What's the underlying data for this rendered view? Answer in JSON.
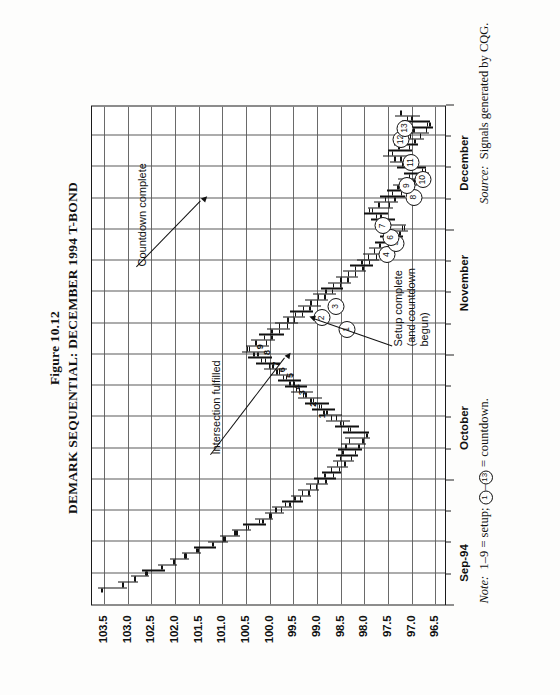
{
  "figure": {
    "number_label": "Figure 10.12",
    "title": "DEMARK SEQUENTIAL: DECEMBER 1994 T-BOND"
  },
  "footnotes": {
    "note_prefix": "Note:",
    "note_text_a": "  1–9 = setup; ",
    "note_circle_low": "1",
    "note_dash": "–",
    "note_circle_high": "13",
    "note_text_b": " = countdown.",
    "source_prefix": "Source:",
    "source_text": "  Signals generated by CQG."
  },
  "annotations": [
    {
      "name": "intersection-fulfilled",
      "text": "Intersection fulfilled"
    },
    {
      "name": "setup-complete",
      "text": "Setup complete\n(and countdown\nbegun)"
    },
    {
      "name": "countdown-complete",
      "text": "Countdown complete"
    }
  ],
  "colors": {
    "ink": "#111111",
    "grid": "#5b5b5b",
    "frame": "#1a1a1a",
    "paper": "#fdfdfc"
  },
  "chart_data": {
    "type": "bar",
    "subtype": "ohlc-bar-chart",
    "title": "DEMARK SEQUENTIAL: DECEMBER 1994 T-BOND",
    "xlabel": "",
    "ylabel": "",
    "ylim": [
      96.25,
      103.75
    ],
    "ytick_labels": [
      "103.5",
      "103.0",
      "102.5",
      "102.0",
      "101.5",
      "101.0",
      "100.5",
      "100.0",
      "99.5",
      "99.0",
      "98.5",
      "98.0",
      "97.5",
      "97.0",
      "96.5"
    ],
    "ytick_values": [
      103.5,
      103.0,
      102.5,
      102.0,
      101.5,
      101.0,
      100.5,
      100.0,
      99.5,
      99.0,
      98.5,
      98.0,
      97.5,
      97.0,
      96.5
    ],
    "grid": true,
    "legend": "none",
    "x_month_labels": [
      "Sep-94",
      "October",
      "November",
      "December"
    ],
    "x_month_positions": [
      0.085,
      0.355,
      0.645,
      0.885
    ],
    "series_name": "December 1994 T-Bond daily OHLC",
    "ohlc": [
      {
        "i": 0,
        "h": 103.62,
        "l": 103.0,
        "o": 103.55,
        "c": 103.12
      },
      {
        "i": 1,
        "h": 103.2,
        "l": 102.78,
        "o": 103.1,
        "c": 102.84
      },
      {
        "i": 2,
        "h": 102.92,
        "l": 102.55,
        "o": 102.86,
        "c": 102.6
      },
      {
        "i": 3,
        "h": 102.7,
        "l": 102.2,
        "o": 102.62,
        "c": 102.28
      },
      {
        "i": 4,
        "h": 102.35,
        "l": 101.95,
        "o": 102.3,
        "c": 102.02
      },
      {
        "i": 5,
        "h": 102.1,
        "l": 101.7,
        "o": 102.04,
        "c": 101.78
      },
      {
        "i": 6,
        "h": 101.85,
        "l": 101.45,
        "o": 101.8,
        "c": 101.52
      },
      {
        "i": 7,
        "h": 101.6,
        "l": 101.12,
        "o": 101.55,
        "c": 101.2
      },
      {
        "i": 8,
        "h": 101.3,
        "l": 100.88,
        "o": 101.22,
        "c": 100.95
      },
      {
        "i": 9,
        "h": 101.05,
        "l": 100.62,
        "o": 100.98,
        "c": 100.7
      },
      {
        "i": 10,
        "h": 100.8,
        "l": 100.4,
        "o": 100.74,
        "c": 100.46
      },
      {
        "i": 11,
        "h": 100.55,
        "l": 100.08,
        "o": 100.5,
        "c": 100.15
      },
      {
        "i": 12,
        "h": 100.3,
        "l": 99.92,
        "o": 100.22,
        "c": 99.98
      },
      {
        "i": 13,
        "h": 100.1,
        "l": 99.7,
        "o": 100.02,
        "c": 99.76
      },
      {
        "i": 14,
        "h": 99.95,
        "l": 99.52,
        "o": 99.88,
        "c": 99.58
      },
      {
        "i": 15,
        "h": 99.74,
        "l": 99.3,
        "o": 99.68,
        "c": 99.36
      },
      {
        "i": 16,
        "h": 99.55,
        "l": 99.12,
        "o": 99.48,
        "c": 99.18
      },
      {
        "i": 17,
        "h": 99.4,
        "l": 98.95,
        "o": 99.32,
        "c": 99.02
      },
      {
        "i": 18,
        "h": 99.22,
        "l": 98.76,
        "o": 99.15,
        "c": 98.82
      },
      {
        "i": 19,
        "h": 99.05,
        "l": 98.6,
        "o": 98.98,
        "c": 98.66
      },
      {
        "i": 20,
        "h": 98.9,
        "l": 98.48,
        "o": 98.84,
        "c": 98.54
      },
      {
        "i": 21,
        "h": 98.78,
        "l": 98.35,
        "o": 98.7,
        "c": 98.42
      },
      {
        "i": 22,
        "h": 98.66,
        "l": 98.22,
        "o": 98.58,
        "c": 98.28
      },
      {
        "i": 23,
        "h": 98.6,
        "l": 98.14,
        "o": 98.52,
        "c": 98.2
      },
      {
        "i": 24,
        "h": 98.55,
        "l": 98.05,
        "o": 98.46,
        "c": 98.12
      },
      {
        "i": 25,
        "h": 98.48,
        "l": 97.96,
        "o": 98.4,
        "c": 98.04
      },
      {
        "i": 26,
        "h": 98.4,
        "l": 97.88,
        "o": 98.32,
        "c": 97.94
      },
      {
        "i": 27,
        "h": 98.45,
        "l": 97.9,
        "o": 97.96,
        "c": 98.34
      },
      {
        "i": 28,
        "h": 98.62,
        "l": 98.1,
        "o": 98.3,
        "c": 98.52
      },
      {
        "i": 29,
        "h": 98.8,
        "l": 98.3,
        "o": 98.45,
        "c": 98.7
      },
      {
        "i": 30,
        "h": 98.95,
        "l": 98.46,
        "o": 98.6,
        "c": 98.86
      },
      {
        "i": 31,
        "h": 99.1,
        "l": 98.62,
        "o": 98.8,
        "c": 98.96
      },
      {
        "i": 32,
        "h": 99.25,
        "l": 98.74,
        "o": 98.92,
        "c": 99.14
      },
      {
        "i": 33,
        "h": 99.4,
        "l": 98.9,
        "o": 99.08,
        "c": 99.3
      },
      {
        "i": 34,
        "h": 99.55,
        "l": 99.08,
        "o": 99.24,
        "c": 99.44
      },
      {
        "i": 35,
        "h": 99.68,
        "l": 99.2,
        "o": 99.38,
        "c": 99.58
      },
      {
        "i": 36,
        "h": 99.82,
        "l": 99.34,
        "o": 99.5,
        "c": 99.72
      },
      {
        "i": 37,
        "h": 99.96,
        "l": 99.48,
        "o": 99.66,
        "c": 99.86
      },
      {
        "i": 38,
        "h": 100.12,
        "l": 99.62,
        "o": 99.8,
        "c": 100.02
      },
      {
        "i": 39,
        "h": 100.28,
        "l": 99.78,
        "o": 99.94,
        "c": 100.18
      },
      {
        "i": 40,
        "h": 100.45,
        "l": 99.94,
        "o": 100.1,
        "c": 100.34
      },
      {
        "i": 41,
        "h": 100.58,
        "l": 100.1,
        "o": 100.26,
        "c": 100.48
      },
      {
        "i": 42,
        "h": 100.5,
        "l": 100.0,
        "o": 100.44,
        "c": 100.08
      },
      {
        "i": 43,
        "h": 100.4,
        "l": 99.88,
        "o": 100.3,
        "c": 99.96
      },
      {
        "i": 44,
        "h": 100.22,
        "l": 99.7,
        "o": 100.12,
        "c": 99.8
      },
      {
        "i": 45,
        "h": 100.05,
        "l": 99.56,
        "o": 99.96,
        "c": 99.64
      },
      {
        "i": 46,
        "h": 99.88,
        "l": 99.4,
        "o": 99.8,
        "c": 99.48
      },
      {
        "i": 47,
        "h": 99.72,
        "l": 99.24,
        "o": 99.62,
        "c": 99.32
      },
      {
        "i": 48,
        "h": 99.56,
        "l": 99.08,
        "o": 99.46,
        "c": 99.16
      },
      {
        "i": 49,
        "h": 99.4,
        "l": 98.92,
        "o": 99.3,
        "c": 99.0
      },
      {
        "i": 50,
        "h": 99.24,
        "l": 98.76,
        "o": 99.14,
        "c": 98.84
      },
      {
        "i": 51,
        "h": 99.08,
        "l": 98.6,
        "o": 98.98,
        "c": 98.68
      },
      {
        "i": 52,
        "h": 98.92,
        "l": 98.44,
        "o": 98.82,
        "c": 98.52
      },
      {
        "i": 53,
        "h": 98.76,
        "l": 98.28,
        "o": 98.66,
        "c": 98.36
      },
      {
        "i": 54,
        "h": 98.6,
        "l": 98.12,
        "o": 98.5,
        "c": 98.2
      },
      {
        "i": 55,
        "h": 98.44,
        "l": 97.96,
        "o": 98.34,
        "c": 98.04
      },
      {
        "i": 56,
        "h": 98.3,
        "l": 97.82,
        "o": 98.2,
        "c": 97.9
      },
      {
        "i": 57,
        "h": 98.16,
        "l": 97.68,
        "o": 98.06,
        "c": 97.76
      },
      {
        "i": 58,
        "h": 98.02,
        "l": 97.54,
        "o": 97.92,
        "c": 97.62
      },
      {
        "i": 59,
        "h": 97.9,
        "l": 97.42,
        "o": 97.8,
        "c": 97.5
      },
      {
        "i": 60,
        "h": 97.78,
        "l": 97.3,
        "o": 97.68,
        "c": 97.38
      },
      {
        "i": 61,
        "h": 97.66,
        "l": 97.18,
        "o": 97.56,
        "c": 97.26
      },
      {
        "i": 62,
        "h": 97.56,
        "l": 97.08,
        "o": 97.46,
        "c": 97.16
      },
      {
        "i": 63,
        "h": 97.7,
        "l": 97.12,
        "o": 97.2,
        "c": 97.6
      },
      {
        "i": 64,
        "h": 97.86,
        "l": 97.34,
        "o": 97.5,
        "c": 97.76
      },
      {
        "i": 65,
        "h": 98.0,
        "l": 97.5,
        "o": 97.66,
        "c": 97.9
      },
      {
        "i": 66,
        "h": 97.92,
        "l": 97.4,
        "o": 97.84,
        "c": 97.48
      },
      {
        "i": 67,
        "h": 97.8,
        "l": 97.28,
        "o": 97.7,
        "c": 97.36
      },
      {
        "i": 68,
        "h": 97.66,
        "l": 97.14,
        "o": 97.56,
        "c": 97.22
      },
      {
        "i": 69,
        "h": 97.52,
        "l": 97.0,
        "o": 97.42,
        "c": 97.08
      },
      {
        "i": 70,
        "h": 97.4,
        "l": 96.88,
        "o": 97.3,
        "c": 96.96
      },
      {
        "i": 71,
        "h": 97.28,
        "l": 96.76,
        "o": 97.18,
        "c": 96.84
      },
      {
        "i": 72,
        "h": 97.16,
        "l": 96.64,
        "o": 97.06,
        "c": 96.72
      },
      {
        "i": 73,
        "h": 97.3,
        "l": 96.7,
        "o": 96.78,
        "c": 97.2
      },
      {
        "i": 74,
        "h": 97.46,
        "l": 96.92,
        "o": 97.1,
        "c": 97.36
      },
      {
        "i": 75,
        "h": 97.6,
        "l": 97.08,
        "o": 97.24,
        "c": 97.5
      },
      {
        "i": 76,
        "h": 97.5,
        "l": 96.98,
        "o": 97.42,
        "c": 97.06
      },
      {
        "i": 77,
        "h": 97.38,
        "l": 96.86,
        "o": 97.28,
        "c": 96.94
      },
      {
        "i": 78,
        "h": 97.26,
        "l": 96.74,
        "o": 97.16,
        "c": 96.82
      },
      {
        "i": 79,
        "h": 97.14,
        "l": 96.62,
        "o": 97.04,
        "c": 96.7
      },
      {
        "i": 80,
        "h": 97.05,
        "l": 96.54,
        "o": 96.96,
        "c": 96.62
      },
      {
        "i": 81,
        "h": 97.2,
        "l": 96.6,
        "o": 96.68,
        "c": 97.1
      },
      {
        "i": 82,
        "h": 97.34,
        "l": 96.82,
        "o": 97.0,
        "c": 97.24
      }
    ],
    "setup_markers": [
      {
        "label": "1",
        "i": 30,
        "price": 98.66
      },
      {
        "label": "2",
        "i": 32,
        "price": 98.84
      },
      {
        "label": "3",
        "i": 34,
        "price": 99.08
      },
      {
        "label": "4",
        "i": 35,
        "price": 99.18
      },
      {
        "label": "5",
        "i": 37,
        "price": 99.34
      },
      {
        "label": "6",
        "i": 38,
        "price": 99.5
      },
      {
        "label": "7",
        "i": 39,
        "price": 99.64
      },
      {
        "label": "8",
        "i": 41,
        "price": 99.82
      },
      {
        "label": "9",
        "i": 42,
        "price": 99.96
      }
    ],
    "countdown_markers": [
      {
        "label": "1",
        "i": 45,
        "price": 98.78
      },
      {
        "label": "2",
        "i": 47,
        "price": 99.32
      },
      {
        "label": "3",
        "i": 49,
        "price": 99.02
      },
      {
        "label": "4",
        "i": 58,
        "price": 97.94
      },
      {
        "label": "5",
        "i": 60,
        "price": 97.74
      },
      {
        "label": "6",
        "i": 61,
        "price": 97.86
      },
      {
        "label": "7",
        "i": 63,
        "price": 98.02
      },
      {
        "label": "8",
        "i": 68,
        "price": 97.36
      },
      {
        "label": "9",
        "i": 70,
        "price": 97.52
      },
      {
        "label": "10",
        "i": 71,
        "price": 97.18
      },
      {
        "label": "11",
        "i": 74,
        "price": 97.44
      },
      {
        "label": "12",
        "i": 78,
        "price": 97.64
      },
      {
        "label": "13",
        "i": 80,
        "price": 97.56
      }
    ]
  }
}
